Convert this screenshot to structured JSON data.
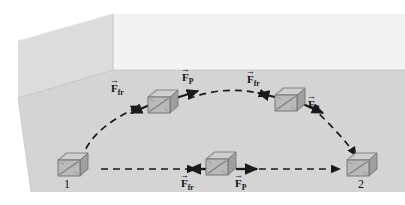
{
  "figure": {
    "type": "physics-diagram",
    "scene": {
      "room": {
        "floor_color": "#d3d3d3",
        "left_wall_color": "#dcdcdc",
        "back_wall_color": "#f2f2f2",
        "edge_color": "#b8b8b8"
      },
      "crate_colors": {
        "front": "#b9b9b9",
        "top": "#cfcfcf",
        "side": "#9f9f9f",
        "outline": "#6e6e6e",
        "brace": "#8a8a8a"
      },
      "path_color": "#1a1a1a"
    },
    "points": [
      {
        "name": "start-point-label",
        "label": "1"
      },
      {
        "name": "end-point-label",
        "label": "2"
      }
    ],
    "force_labels": [
      {
        "name": "friction-force-label-upper-left",
        "symbol": "F",
        "subscript": "fr",
        "arrow": "→"
      },
      {
        "name": "applied-force-label-upper-left",
        "symbol": "F",
        "subscript": "P",
        "arrow": "→"
      },
      {
        "name": "friction-force-label-upper-right",
        "symbol": "F",
        "subscript": "fr",
        "arrow": "→"
      },
      {
        "name": "applied-force-label-upper-right",
        "symbol": "F",
        "subscript": "P",
        "arrow": "→"
      },
      {
        "name": "friction-force-label-lower",
        "symbol": "F",
        "subscript": "fr",
        "arrow": "→"
      },
      {
        "name": "applied-force-label-lower",
        "symbol": "F",
        "subscript": "P",
        "arrow": "→"
      }
    ],
    "paths": [
      {
        "name": "curved-path",
        "style": "dashed",
        "shape": "arc-over-the-top"
      },
      {
        "name": "straight-path",
        "style": "dashed",
        "shape": "horizontal-line"
      }
    ],
    "crates": [
      {
        "name": "crate-at-point-1",
        "x": 70,
        "y": 165
      },
      {
        "name": "crate-on-curve-left",
        "x": 157,
        "y": 104
      },
      {
        "name": "crate-on-curve-right",
        "x": 283,
        "y": 102
      },
      {
        "name": "crate-on-straight-path",
        "x": 215,
        "y": 162
      },
      {
        "name": "crate-at-point-2",
        "x": 360,
        "y": 165
      }
    ]
  }
}
